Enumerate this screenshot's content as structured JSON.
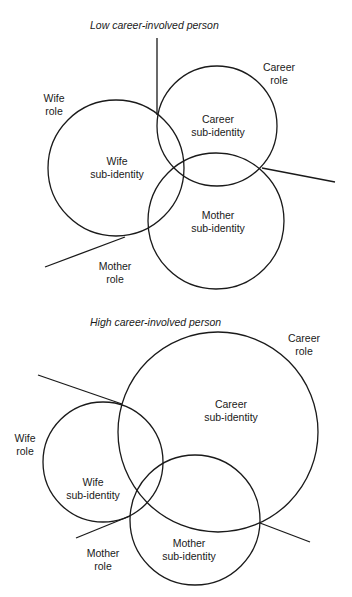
{
  "diagrams": [
    {
      "title": "Low career-involved person",
      "labels": {
        "career_role": [
          "Career",
          "role"
        ],
        "wife_role": [
          "Wife",
          "role"
        ],
        "mother_role": [
          "Mother",
          "role"
        ],
        "career_sub": [
          "Career",
          "sub-identity"
        ],
        "wife_sub": [
          "Wife",
          "sub-identity"
        ],
        "mother_sub": [
          "Mother",
          "sub-identity"
        ]
      }
    },
    {
      "title": "High career-involved person",
      "labels": {
        "career_role": [
          "Career",
          "role"
        ],
        "wife_role": [
          "Wife",
          "role"
        ],
        "mother_role": [
          "Mother",
          "role"
        ],
        "career_sub": [
          "Career",
          "sub-identity"
        ],
        "wife_sub": [
          "Wife",
          "sub-identity"
        ],
        "mother_sub": [
          "Mother",
          "sub-identity"
        ]
      }
    }
  ],
  "colors": {
    "stroke": "#1a1a1a",
    "background": "#ffffff"
  }
}
